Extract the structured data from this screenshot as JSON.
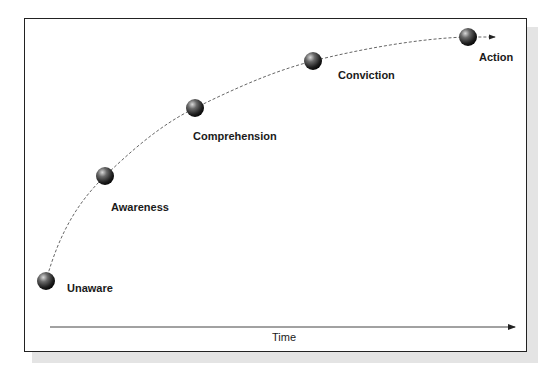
{
  "diagram": {
    "stages": [
      {
        "label": "Unaware",
        "x": 46,
        "y": 281,
        "label_x": 67,
        "label_y": 282
      },
      {
        "label": "Awareness",
        "x": 105,
        "y": 176,
        "label_x": 111,
        "label_y": 201
      },
      {
        "label": "Comprehension",
        "x": 195,
        "y": 108,
        "label_x": 193,
        "label_y": 130
      },
      {
        "label": "Conviction",
        "x": 313,
        "y": 61,
        "label_x": 338,
        "label_y": 69
      },
      {
        "label": "Action",
        "x": 468,
        "y": 37,
        "label_x": 479,
        "label_y": 51
      }
    ],
    "x_axis": {
      "label": "Time"
    },
    "colors": {
      "sphere": "#3a3a3a",
      "line": "#555555",
      "frame": "#222222",
      "shadow": "#e4e4e4"
    }
  }
}
